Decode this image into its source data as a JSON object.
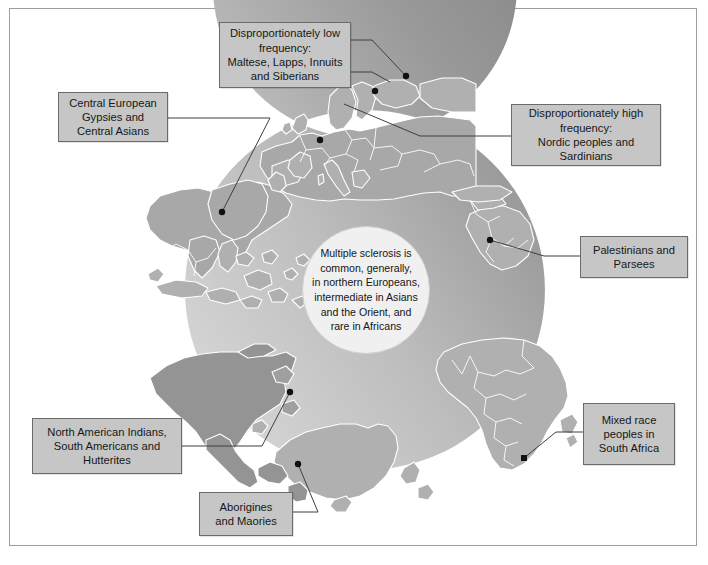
{
  "figure": {
    "center_text": "Multiple sclerosis is\ncommon, generally,\nin northern Europeans,\nintermediate in Asians\nand the Orient, and\nrare in Africans"
  },
  "colors": {
    "background": "#ffffff",
    "frame_border": "#9d9d9d",
    "callout_fill": "#c6c6c6",
    "callout_border": "#6b6b6b",
    "center_fill": "#f0f0f0",
    "land_light": "#b8b8b8",
    "land_mid": "#a8a8a8",
    "land_dark": "#949494",
    "ring_dark": "#8c8c8c",
    "ring_light": "#cfcfcf",
    "leader_line": "#4a4a4a",
    "marker": "#111111",
    "country_border": "#ffffff"
  },
  "callouts": [
    {
      "id": "low-frequency",
      "text": "Disproportionately low\nfrequency:\nMaltese, Lapps, Innuits\nand Siberians",
      "markers": [
        "Scandinavia-north",
        "Arctic-Russia"
      ]
    },
    {
      "id": "high-frequency",
      "text": "Disproportionately high\nfrequency:\nNordic peoples and\nSardinians",
      "markers": [
        "Nordic",
        "Sardinia"
      ]
    },
    {
      "id": "central-european-gypsies",
      "text": "Central European\nGypsies and\nCentral Asians",
      "markers": [
        "Central-Asia"
      ]
    },
    {
      "id": "palestinians-parsees",
      "text": "Palestinians and\nParsees",
      "markers": [
        "Levant"
      ]
    },
    {
      "id": "mixed-race-south-africa",
      "text": "Mixed race\npeoples in\nSouth Africa",
      "markers": [
        "South-Africa"
      ]
    },
    {
      "id": "north-american-indians",
      "text": "North American Indians,\nSouth Americans and\nHutterites",
      "markers": [
        "North-America"
      ]
    },
    {
      "id": "aborigines-maories",
      "text": "Aborigines\nand Maories",
      "markers": [
        "Australia"
      ]
    }
  ]
}
